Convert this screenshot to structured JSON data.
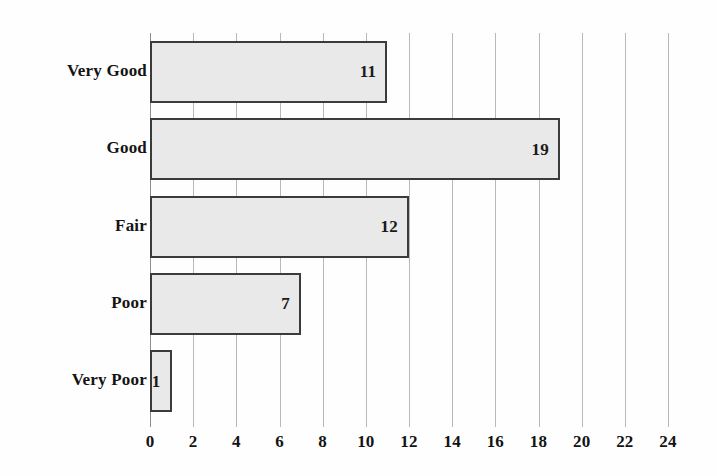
{
  "chart_data": {
    "type": "bar",
    "orientation": "horizontal",
    "title": "",
    "subtitle": "",
    "xlabel": "",
    "ylabel": "",
    "categories": [
      "Very Good",
      "Good",
      "Fair",
      "Poor",
      "Very Poor"
    ],
    "values": [
      11,
      19,
      12,
      7,
      1
    ],
    "value_labels": [
      "11",
      "19",
      "12",
      "7",
      "1"
    ],
    "xticks": [
      0,
      2,
      4,
      6,
      8,
      10,
      12,
      14,
      16,
      18,
      20,
      22,
      24
    ],
    "xtick_labels": [
      "0",
      "2",
      "4",
      "6",
      "8",
      "10",
      "12",
      "14",
      "16",
      "18",
      "20",
      "22",
      "24"
    ],
    "xlim": [
      0,
      24
    ],
    "grid": "vertical",
    "legend": "none",
    "annotations": [],
    "colors": {
      "bar_fill": "#e9e9e9",
      "bar_border": "#3b3b3b",
      "gridline": "#b9b9b9",
      "axis": "#8d8d8d",
      "text": "#141414",
      "background": "#fefefe"
    }
  }
}
